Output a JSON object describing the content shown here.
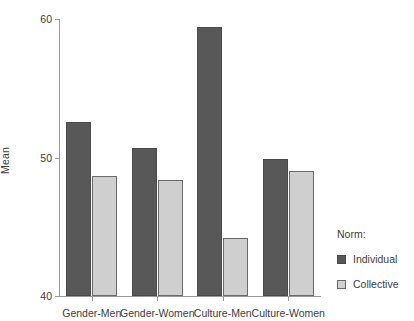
{
  "chart_data": {
    "type": "bar",
    "title": "",
    "subtitle": "",
    "xlabel": "",
    "ylabel": "Mean",
    "ylim": [
      40,
      60
    ],
    "yticks": [
      40,
      50,
      60
    ],
    "ytick_labels": [
      "40",
      "50",
      "60"
    ],
    "grid": false,
    "legend_position": "right",
    "legend_title": "Norm:",
    "categories": [
      "Gender-Men",
      "Gender-Women",
      "Culture-Men",
      "Culture-Women"
    ],
    "series": [
      {
        "name": "Individual",
        "color": "#585858",
        "values": [
          52.6,
          50.7,
          59.4,
          49.9
        ]
      },
      {
        "name": "Collective",
        "color": "#cfcfcf",
        "values": [
          48.7,
          48.4,
          44.2,
          49.0
        ]
      }
    ]
  },
  "axes": {
    "y_title": "Mean",
    "y_tick_labels": [
      "60",
      "50",
      "40"
    ],
    "x_tick_labels": [
      "Gender-Men",
      "Gender-Women",
      "Culture-Men",
      "Culture-Women"
    ]
  },
  "legend": {
    "title": "Norm:",
    "entries": [
      {
        "label": "Individual",
        "swatch": "individual-swatch"
      },
      {
        "label": "Collective",
        "swatch": "collective-swatch"
      }
    ]
  },
  "colors": {
    "individual": "#585858",
    "collective": "#cfcfcf",
    "axis": "#9a9a9a",
    "text": "#3d3d3d",
    "background": "#ffffff"
  }
}
